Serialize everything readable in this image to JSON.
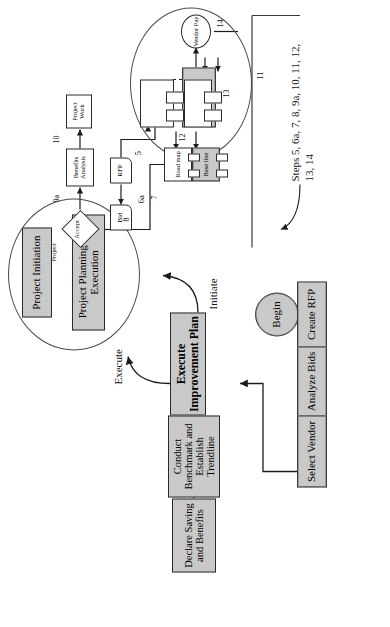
{
  "diagram": {
    "orientation": "rotated-90-ccw",
    "colors": {
      "node_fill": "#c9c9c9",
      "stroke": "#2b2b2b",
      "background": "#ffffff"
    }
  },
  "main_flow": {
    "start": {
      "label": "Begin"
    },
    "steps": [
      {
        "id": "create-rfp",
        "label": "Create RFP"
      },
      {
        "id": "analyze-bids",
        "label": "Analyze Bids"
      },
      {
        "id": "select-vendor",
        "label": "Select Vendor"
      },
      {
        "id": "execute-improvement-plan",
        "label": "Execute Improvement Plan"
      },
      {
        "id": "conduct-benchmark",
        "label": "Conduct Benchmark and Establish Trendline"
      },
      {
        "id": "declare-saving",
        "label": "Declare Saving and Benefits"
      }
    ]
  },
  "edge_labels": {
    "initiate": "Initiate",
    "execute": "Execute",
    "steps_note": "Steps 5, 6a, 7, 8, 9a, 10, 11, 12, 13, 14"
  },
  "project_group": {
    "nodes": [
      {
        "id": "project-initiation",
        "label": "Project Initiation"
      },
      {
        "id": "project-planning-execution",
        "label": "Project Planning and Execution"
      }
    ]
  },
  "detail_group": {
    "nodes": [
      {
        "id": "rfp-doc",
        "label": "RFP"
      },
      {
        "id": "bid-doc",
        "label": "Bid"
      },
      {
        "id": "accept-decision",
        "label": "Accept"
      },
      {
        "id": "accept-decision-caption",
        "label": "Project"
      },
      {
        "id": "benefits-analysis",
        "label": "Benefits Analysis"
      },
      {
        "id": "project-work",
        "label": "Project Work"
      },
      {
        "id": "road-map",
        "label": "Road map"
      },
      {
        "id": "base-line",
        "label": "Base line"
      },
      {
        "id": "pif",
        "label": "PIF"
      },
      {
        "id": "vendor-pay",
        "label": "Vendor Pay"
      }
    ],
    "step_numbers": [
      "5",
      "6a",
      "7",
      "8",
      "9a",
      "10",
      "11",
      "12",
      "13",
      "14"
    ]
  }
}
